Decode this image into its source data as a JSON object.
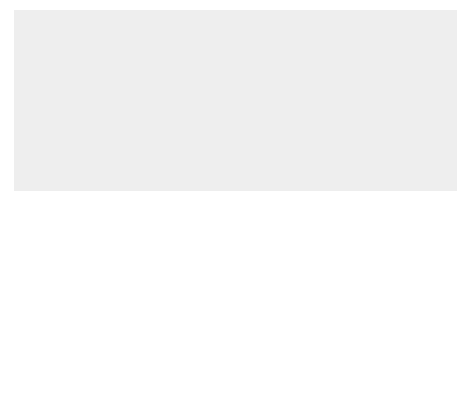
{
  "figure": {
    "number": "Figure 11.19",
    "caption": "The use of a magnifying glass.",
    "background_color": "#eeeeee",
    "canvas_color": "#ffffff",
    "line_color": "#2a2a2a"
  },
  "labels": {
    "enlarged_virtual_image": "Enlarged\nvirtual\nimage",
    "object": "Object",
    "simple_magnifier": "Simple\nmagnifier",
    "principal_focus": "Principal\nfocus"
  },
  "elements": {
    "optical_axis": "optical-axis",
    "lens": "convex-lens",
    "object_arrow": "object-arrow",
    "virtual_image_arrow": "virtual-image-arrow",
    "eye": "eye-icon"
  }
}
